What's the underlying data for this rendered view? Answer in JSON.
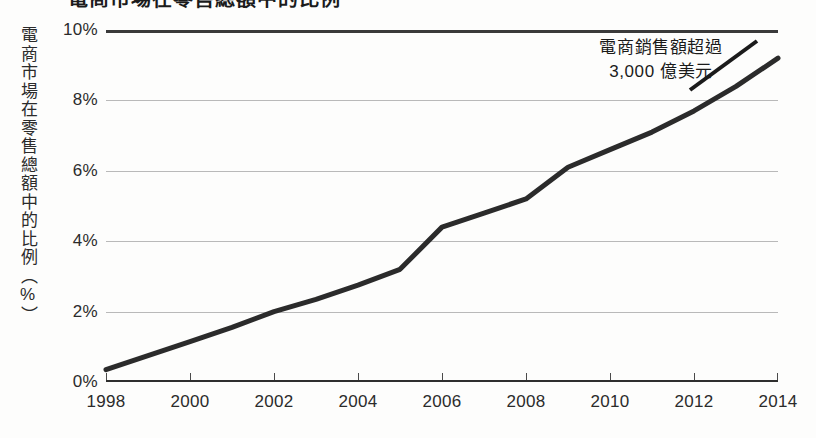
{
  "figure": {
    "title_cropped": "電商市場在零售總額中的比例",
    "background_color": "#fdfdfc"
  },
  "axes": {
    "y_axis_title": "電商市場在零售總額中的比例（%）",
    "y_ticks": [
      "10%",
      "8%",
      "6%",
      "4%",
      "2%",
      "0%"
    ],
    "x_ticks": [
      "1998",
      "2000",
      "2002",
      "2004",
      "2006",
      "2008",
      "2010",
      "2012",
      "2014"
    ]
  },
  "annotation": {
    "line1": "電商銷售額超過",
    "line2": "3,000 億美元"
  },
  "chart_data": {
    "type": "line",
    "title": "電商市場在零售總額中的比例",
    "xlabel": "",
    "ylabel": "電商市場在零售總額中的比例（%）",
    "xlim": [
      1998,
      2014
    ],
    "ylim": [
      0,
      10
    ],
    "grid": true,
    "legend": "none",
    "line_color": "#2b2b2b",
    "line_width_px": 5,
    "x": [
      1998,
      1999,
      2000,
      2001,
      2002,
      2003,
      2004,
      2005,
      2006,
      2007,
      2008,
      2009,
      2010,
      2011,
      2012,
      2013,
      2014
    ],
    "values": [
      0.35,
      0.75,
      1.15,
      1.55,
      2.0,
      2.35,
      2.75,
      3.2,
      4.4,
      4.8,
      5.2,
      6.1,
      6.6,
      7.1,
      7.7,
      8.4,
      9.2
    ],
    "categories": [
      "1998",
      "1999",
      "2000",
      "2001",
      "2002",
      "2003",
      "2004",
      "2005",
      "2006",
      "2007",
      "2008",
      "2009",
      "2010",
      "2011",
      "2012",
      "2013",
      "2014"
    ],
    "annotations": [
      {
        "text": "電商銷售額超過 3,000 億美元",
        "points_to_year": 2013
      }
    ]
  }
}
